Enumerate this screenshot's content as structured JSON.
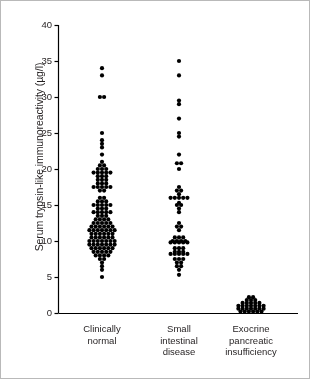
{
  "figure": {
    "background": "#ffffff",
    "border_color": "#b9b9b9",
    "ink_color": "#000000"
  },
  "chart_data": {
    "type": "scatter",
    "title": "",
    "xlabel": "",
    "ylabel": "Serum trypsin-like immunoreactivity (µg/l)",
    "ylim": [
      0,
      40
    ],
    "yticks": [
      0,
      5,
      10,
      15,
      20,
      25,
      30,
      35,
      40
    ],
    "ytick_labels": [
      "0",
      "5",
      "10",
      "15",
      "20",
      "25",
      "30",
      "35",
      "40"
    ],
    "grid": false,
    "legend": null,
    "axis_style": "left-and-bottom-spine",
    "marker": "filled-circle",
    "marker_color": "#000000",
    "marker_size_px": 3.4,
    "categories": [
      "Clinically normal",
      "Small intestinal disease",
      "Exocrine pancreatic insufficiency"
    ],
    "category_labels_wrapped": [
      [
        "Clinically",
        "normal"
      ],
      [
        "Small",
        "intestinal",
        "disease"
      ],
      [
        "Exocrine",
        "pancreatic",
        "insufficiency"
      ]
    ],
    "series": [
      {
        "name": "Clinically normal",
        "category_index": 0,
        "n": 116,
        "summary": {
          "min": 5.0,
          "max": 34.0,
          "median": 11.5,
          "bulk_range": [
            8.0,
            20.0
          ]
        },
        "stacks": [
          {
            "value": 34.0,
            "count": 1
          },
          {
            "value": 33.0,
            "count": 1
          },
          {
            "value": 30.0,
            "count": 2
          },
          {
            "value": 25.0,
            "count": 1
          },
          {
            "value": 24.0,
            "count": 1
          },
          {
            "value": 23.5,
            "count": 1
          },
          {
            "value": 23.0,
            "count": 1
          },
          {
            "value": 22.0,
            "count": 1
          },
          {
            "value": 21.0,
            "count": 1
          },
          {
            "value": 20.5,
            "count": 2
          },
          {
            "value": 20.0,
            "count": 3
          },
          {
            "value": 19.5,
            "count": 5
          },
          {
            "value": 19.0,
            "count": 3
          },
          {
            "value": 18.5,
            "count": 3
          },
          {
            "value": 18.0,
            "count": 3
          },
          {
            "value": 17.5,
            "count": 5
          },
          {
            "value": 17.0,
            "count": 2
          },
          {
            "value": 16.0,
            "count": 2
          },
          {
            "value": 15.5,
            "count": 3
          },
          {
            "value": 15.0,
            "count": 5
          },
          {
            "value": 14.5,
            "count": 3
          },
          {
            "value": 14.0,
            "count": 5
          },
          {
            "value": 13.5,
            "count": 3
          },
          {
            "value": 13.0,
            "count": 4
          },
          {
            "value": 12.5,
            "count": 5
          },
          {
            "value": 12.0,
            "count": 6
          },
          {
            "value": 11.5,
            "count": 7
          },
          {
            "value": 11.0,
            "count": 6
          },
          {
            "value": 10.5,
            "count": 6
          },
          {
            "value": 10.0,
            "count": 7
          },
          {
            "value": 9.5,
            "count": 7
          },
          {
            "value": 9.0,
            "count": 6
          },
          {
            "value": 8.5,
            "count": 5
          },
          {
            "value": 8.0,
            "count": 4
          },
          {
            "value": 7.5,
            "count": 2
          },
          {
            "value": 7.0,
            "count": 1
          },
          {
            "value": 6.5,
            "count": 1
          },
          {
            "value": 6.0,
            "count": 1
          },
          {
            "value": 5.0,
            "count": 1
          }
        ]
      },
      {
        "name": "Small intestinal disease",
        "category_index": 1,
        "n": 63,
        "summary": {
          "min": 5.3,
          "max": 35.0,
          "median": 9.5,
          "bulk_range": [
            7.5,
            16.0
          ]
        },
        "stacks": [
          {
            "value": 35.0,
            "count": 1
          },
          {
            "value": 33.0,
            "count": 1
          },
          {
            "value": 29.5,
            "count": 1
          },
          {
            "value": 29.0,
            "count": 1
          },
          {
            "value": 27.0,
            "count": 1
          },
          {
            "value": 25.0,
            "count": 1
          },
          {
            "value": 24.5,
            "count": 1
          },
          {
            "value": 22.0,
            "count": 1
          },
          {
            "value": 20.8,
            "count": 2
          },
          {
            "value": 20.0,
            "count": 1
          },
          {
            "value": 17.5,
            "count": 1
          },
          {
            "value": 17.0,
            "count": 2
          },
          {
            "value": 16.5,
            "count": 1
          },
          {
            "value": 16.0,
            "count": 5
          },
          {
            "value": 15.3,
            "count": 1
          },
          {
            "value": 15.0,
            "count": 2
          },
          {
            "value": 14.5,
            "count": 1
          },
          {
            "value": 14.0,
            "count": 1
          },
          {
            "value": 12.5,
            "count": 1
          },
          {
            "value": 12.0,
            "count": 2
          },
          {
            "value": 11.5,
            "count": 1
          },
          {
            "value": 10.5,
            "count": 3
          },
          {
            "value": 10.0,
            "count": 4
          },
          {
            "value": 9.8,
            "count": 5
          },
          {
            "value": 9.0,
            "count": 3
          },
          {
            "value": 8.5,
            "count": 3
          },
          {
            "value": 8.2,
            "count": 5
          },
          {
            "value": 7.5,
            "count": 3
          },
          {
            "value": 7.0,
            "count": 2
          },
          {
            "value": 6.5,
            "count": 2
          },
          {
            "value": 6.0,
            "count": 1
          },
          {
            "value": 5.3,
            "count": 1
          }
        ]
      },
      {
        "name": "Exocrine pancreatic insufficiency",
        "category_index": 2,
        "n": 30,
        "summary": {
          "min": 0.2,
          "max": 2.2,
          "median": 0.6,
          "bulk_range": [
            0.2,
            1.5
          ]
        },
        "stacks": [
          {
            "value": 2.2,
            "count": 2
          },
          {
            "value": 1.8,
            "count": 3
          },
          {
            "value": 1.4,
            "count": 5
          },
          {
            "value": 1.0,
            "count": 7
          },
          {
            "value": 0.6,
            "count": 7
          },
          {
            "value": 0.2,
            "count": 6
          }
        ]
      }
    ]
  }
}
